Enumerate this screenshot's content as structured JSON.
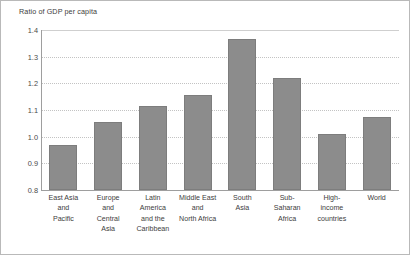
{
  "chart_data": {
    "type": "bar",
    "title": "Ratio of GDP per capita",
    "xlabel": "",
    "ylabel": "",
    "ylim": [
      0.8,
      1.4
    ],
    "yticks": [
      "0.8",
      "0.9",
      "1.0",
      "1.1",
      "1.2",
      "1.3",
      "1.4"
    ],
    "grid": true,
    "legend": "none",
    "bar_color": "#8c8c8c",
    "categories": [
      "East Asia and Pacific",
      "Europe and Central Asia",
      "Latin America and the Caribbean",
      "Middle East and North Africa",
      "South Asia",
      "Sub-Saharan Africa",
      "High-income countries",
      "World"
    ],
    "category_lines": [
      [
        "East Asia",
        "and",
        "Pacific"
      ],
      [
        "Europe",
        "and",
        "Central",
        "Asia"
      ],
      [
        "Latin",
        "America",
        "and the",
        "Caribbean"
      ],
      [
        "Middle East",
        "and",
        "North Africa"
      ],
      [
        "South",
        "Asia"
      ],
      [
        "Sub-",
        "Saharan",
        "Africa"
      ],
      [
        "High-",
        "income",
        "countries"
      ],
      [
        "World"
      ]
    ],
    "values": [
      0.97,
      1.055,
      1.115,
      1.155,
      1.365,
      1.22,
      1.01,
      1.075
    ]
  }
}
